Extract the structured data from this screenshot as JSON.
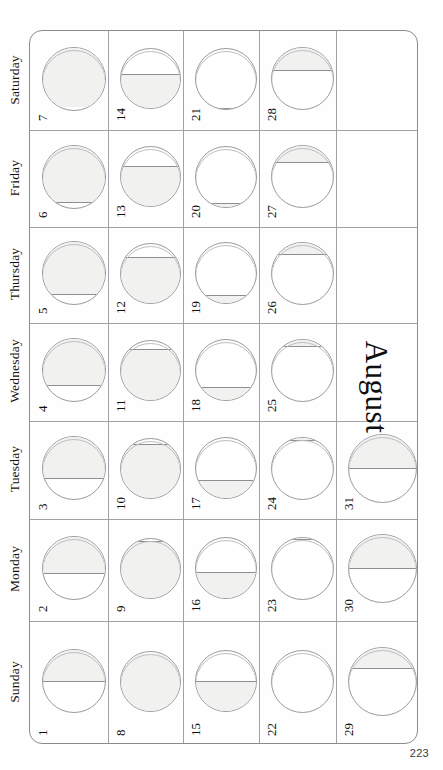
{
  "page": {
    "month_title": "August",
    "page_number": "223",
    "orientation": "rotated-90",
    "background_color": "#fefefe",
    "rule_color": "#a2a2a6",
    "lit_color": "#f1f1f0",
    "outline_color": "#9a9a9e"
  },
  "weekday_labels": [
    "Saturday",
    "Friday",
    "Thursday",
    "Wednesday",
    "Tuesday",
    "Monday",
    "Sunday"
  ],
  "chart_data": {
    "type": "table",
    "title": "August",
    "xlabel": "Week",
    "ylabel": "Weekday",
    "categories": [
      "Week 1",
      "Week 2",
      "Week 3",
      "Week 4",
      "Week 5"
    ],
    "series_label": "Moon illuminated fraction (%)",
    "rows": [
      {
        "weekday": "Saturday",
        "cells": [
          {
            "date": "7",
            "illumination": 97,
            "lit_side": "top",
            "phase": "full"
          },
          {
            "date": "14",
            "illumination": 58,
            "lit_side": "bottom",
            "phase": "waning-gibbous"
          },
          {
            "date": "21",
            "illumination": 2,
            "lit_side": "bottom",
            "phase": "new"
          },
          {
            "date": "28",
            "illumination": 38,
            "lit_side": "top",
            "phase": "waxing-crescent"
          },
          {
            "date": "",
            "illumination": null,
            "lit_side": "none",
            "phase": "empty"
          }
        ]
      },
      {
        "weekday": "Friday",
        "cells": [
          {
            "date": "6",
            "illumination": 92,
            "lit_side": "top",
            "phase": "waxing-gibbous"
          },
          {
            "date": "13",
            "illumination": 68,
            "lit_side": "bottom",
            "phase": "waning-gibbous"
          },
          {
            "date": "20",
            "illumination": 6,
            "lit_side": "bottom",
            "phase": "waning-crescent"
          },
          {
            "date": "27",
            "illumination": 28,
            "lit_side": "top",
            "phase": "waxing-crescent"
          },
          {
            "date": "",
            "illumination": null,
            "lit_side": "none",
            "phase": "empty"
          }
        ]
      },
      {
        "weekday": "Thursday",
        "cells": [
          {
            "date": "5",
            "illumination": 85,
            "lit_side": "top",
            "phase": "waxing-gibbous"
          },
          {
            "date": "12",
            "illumination": 78,
            "lit_side": "bottom",
            "phase": "waning-gibbous"
          },
          {
            "date": "19",
            "illumination": 13,
            "lit_side": "bottom",
            "phase": "waning-crescent"
          },
          {
            "date": "26",
            "illumination": 20,
            "lit_side": "top",
            "phase": "waxing-crescent"
          },
          {
            "date": "",
            "illumination": null,
            "lit_side": "none",
            "phase": "empty"
          }
        ]
      },
      {
        "weekday": "Wednesday",
        "cells": [
          {
            "date": "4",
            "illumination": 75,
            "lit_side": "top",
            "phase": "waxing-gibbous"
          },
          {
            "date": "11",
            "illumination": 86,
            "lit_side": "bottom",
            "phase": "waning-gibbous"
          },
          {
            "date": "18",
            "illumination": 21,
            "lit_side": "bottom",
            "phase": "waning-crescent"
          },
          {
            "date": "25",
            "illumination": 12,
            "lit_side": "top",
            "phase": "waxing-crescent"
          },
          {
            "date": "",
            "illumination": null,
            "lit_side": "none",
            "phase": "empty"
          }
        ]
      },
      {
        "weekday": "Tuesday",
        "cells": [
          {
            "date": "3",
            "illumination": 68,
            "lit_side": "top",
            "phase": "waxing-gibbous"
          },
          {
            "date": "10",
            "illumination": 92,
            "lit_side": "bottom",
            "phase": "waning-gibbous"
          },
          {
            "date": "17",
            "illumination": 30,
            "lit_side": "bottom",
            "phase": "last-quarter"
          },
          {
            "date": "24",
            "illumination": 5,
            "lit_side": "top",
            "phase": "new"
          },
          {
            "date": "31",
            "illumination": 50,
            "lit_side": "top",
            "phase": "first-quarter"
          }
        ]
      },
      {
        "weekday": "Monday",
        "cells": [
          {
            "date": "2",
            "illumination": 60,
            "lit_side": "top",
            "phase": "waxing-gibbous"
          },
          {
            "date": "9",
            "illumination": 96,
            "lit_side": "bottom",
            "phase": "full"
          },
          {
            "date": "16",
            "illumination": 44,
            "lit_side": "bottom",
            "phase": "last-quarter"
          },
          {
            "date": "23",
            "illumination": 3,
            "lit_side": "top",
            "phase": "new"
          },
          {
            "date": "30",
            "illumination": 50,
            "lit_side": "top",
            "phase": "first-quarter"
          }
        ]
      },
      {
        "weekday": "Sunday",
        "cells": [
          {
            "date": "1",
            "illumination": 52,
            "lit_side": "top",
            "phase": "first-quarter"
          },
          {
            "date": "8",
            "illumination": 99,
            "lit_side": "bottom",
            "phase": "full"
          },
          {
            "date": "15",
            "illumination": 50,
            "lit_side": "bottom",
            "phase": "last-quarter"
          },
          {
            "date": "22",
            "illumination": 1,
            "lit_side": "top",
            "phase": "new"
          },
          {
            "date": "29",
            "illumination": 32,
            "lit_side": "top",
            "phase": "waxing-crescent"
          }
        ]
      }
    ]
  }
}
